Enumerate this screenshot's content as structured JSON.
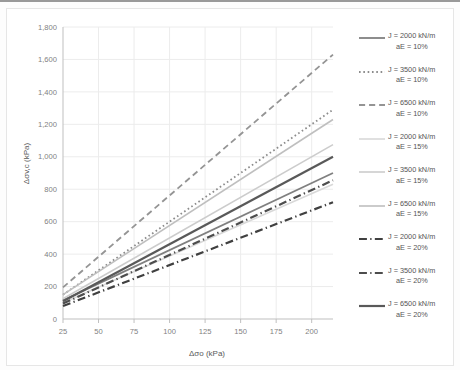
{
  "chart_data": {
    "type": "line",
    "title": "",
    "xlabel": "Δσo (kPa)",
    "ylabel": "Δσv,c (kPa)",
    "xlim": [
      25,
      215
    ],
    "ylim": [
      0,
      1800
    ],
    "xticks": [
      25,
      50,
      75,
      100,
      125,
      150,
      175,
      200
    ],
    "yticks": [
      0,
      200,
      400,
      600,
      800,
      1000,
      1200,
      1400,
      1600,
      1800
    ],
    "ytick_labels": [
      "0",
      "200",
      "400",
      "600",
      "800",
      "1,000",
      "1,200",
      "1,400",
      "1,600",
      "1,800"
    ],
    "xtick_labels": [
      "25",
      "50",
      "75",
      "100",
      "125",
      "150",
      "175",
      "200"
    ],
    "grid": true,
    "legend_position": "right",
    "x": [
      25,
      215
    ],
    "series": [
      {
        "name": "J = 2000 kN/m  aE = 10%",
        "J": 2000,
        "aE": "10%",
        "style": "solid",
        "color": "#808080",
        "width": 1.8,
        "values": [
          115,
          900
        ]
      },
      {
        "name": "J = 3500 kN/m  aE = 10%",
        "J": 3500,
        "aE": "10%",
        "style": "dotted",
        "color": "#8c8c8c",
        "width": 1.8,
        "values": [
          150,
          1290
        ]
      },
      {
        "name": "J = 6500 kN/m  aE = 10%",
        "J": 6500,
        "aE": "10%",
        "style": "dashed",
        "color": "#949494",
        "width": 1.8,
        "values": [
          195,
          1630
        ]
      },
      {
        "name": "J = 2000 kN/m  aE = 15%",
        "J": 2000,
        "aE": "15%",
        "style": "solid",
        "color": "#d9d9d9",
        "width": 1.6,
        "values": [
          100,
          830
        ]
      },
      {
        "name": "J = 3500 kN/m  aE = 15%",
        "J": 3500,
        "aE": "15%",
        "style": "solid",
        "color": "#cccccc",
        "width": 1.6,
        "values": [
          125,
          1075
        ]
      },
      {
        "name": "J = 6500 kN/m  aE = 15%",
        "J": 6500,
        "aE": "15%",
        "style": "solid",
        "color": "#bfbfbf",
        "width": 1.6,
        "values": [
          150,
          1230
        ]
      },
      {
        "name": "J = 2000 kN/m  aE = 20%",
        "J": 2000,
        "aE": "20%",
        "style": "dashdot",
        "color": "#404040",
        "width": 2.2,
        "values": [
          80,
          720
        ]
      },
      {
        "name": "J = 3500 kN/m  aE = 20%",
        "J": 3500,
        "aE": "20%",
        "style": "dashdot",
        "color": "#4d4d4d",
        "width": 2.2,
        "values": [
          95,
          855
        ]
      },
      {
        "name": "J = 6500 kN/m  aE = 20%",
        "J": 6500,
        "aE": "20%",
        "style": "solid",
        "color": "#595959",
        "width": 2.2,
        "values": [
          110,
          1000
        ]
      }
    ]
  },
  "legend": {
    "items": [
      {
        "line1": "J = 2000 kN/m",
        "line2": "aE = 10%"
      },
      {
        "line1": "J = 3500 kN/m",
        "line2": "aE = 10%"
      },
      {
        "line1": "J = 6500 kN/m",
        "line2": "aE = 10%"
      },
      {
        "line1": "J = 2000 kN/m",
        "line2": "aE = 15%"
      },
      {
        "line1": "J = 3500 kN/m",
        "line2": "aE = 15%"
      },
      {
        "line1": "J = 6500 kN/m",
        "line2": "aE = 15%"
      },
      {
        "line1": "J = 2000 kN/m",
        "line2": "aE = 20%"
      },
      {
        "line1": "J = 3500 kN/m",
        "line2": "aE = 20%"
      },
      {
        "line1": "J = 6500 kN/m",
        "line2": "aE = 20%"
      }
    ]
  }
}
